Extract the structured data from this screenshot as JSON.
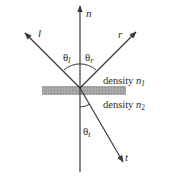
{
  "diagram": {
    "normal_label": "n",
    "incident_label": "l",
    "reflected_label": "r",
    "transmitted_label": "t",
    "angle_incident": "θ",
    "angle_incident_sub": "l",
    "angle_reflected": "θ",
    "angle_reflected_sub": "r",
    "angle_transmitted": "θ",
    "angle_transmitted_sub": "t",
    "medium_upper": "density ",
    "medium_upper_var": "n",
    "medium_upper_sub": "1",
    "medium_lower": "density ",
    "medium_lower_var": "n",
    "medium_lower_sub": "2",
    "colors": {
      "line": "#3a3a3a",
      "surface": "#9a9a9a",
      "text": "#2a2a2a"
    }
  }
}
